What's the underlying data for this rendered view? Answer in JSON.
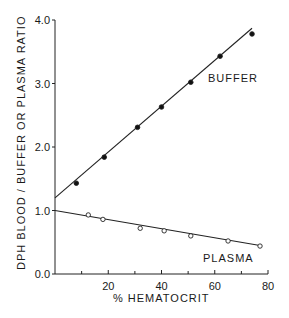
{
  "chart_data": {
    "type": "scatter",
    "title": "",
    "xlabel": "% HEMATOCRIT",
    "ylabel": "DPH BLOOD / BUFFER OR PLASMA RATIO",
    "xlim": [
      0,
      80
    ],
    "ylim": [
      0.0,
      4.0
    ],
    "x_ticks": [
      20,
      40,
      60,
      80
    ],
    "x_minor_ticks": [
      10,
      30,
      50,
      70
    ],
    "y_ticks": [
      "0.0",
      "1.0",
      "2.0",
      "3.0",
      "4.0"
    ],
    "grid": false,
    "legend": "inline labels",
    "series": [
      {
        "name": "BUFFER",
        "marker": "filled-circle",
        "points": [
          {
            "x": 8,
            "y": 1.43
          },
          {
            "x": 18.5,
            "y": 1.84
          },
          {
            "x": 31,
            "y": 2.31
          },
          {
            "x": 40,
            "y": 2.63
          },
          {
            "x": 51,
            "y": 3.02
          },
          {
            "x": 62,
            "y": 3.43
          },
          {
            "x": 74,
            "y": 3.78
          }
        ],
        "fit_line": {
          "x0": 0,
          "y0": 1.2,
          "x1": 74,
          "y1": 3.87
        }
      },
      {
        "name": "PLASMA",
        "marker": "open-circle",
        "points": [
          {
            "x": 12.5,
            "y": 0.93
          },
          {
            "x": 18,
            "y": 0.86
          },
          {
            "x": 32,
            "y": 0.72
          },
          {
            "x": 41,
            "y": 0.68
          },
          {
            "x": 51,
            "y": 0.6
          },
          {
            "x": 65,
            "y": 0.52
          },
          {
            "x": 77,
            "y": 0.44
          }
        ],
        "fit_line": {
          "x0": 0,
          "y0": 1.0,
          "x1": 77,
          "y1": 0.45
        }
      }
    ]
  },
  "labels": {
    "buffer": "BUFFER",
    "plasma": "PLASMA",
    "xlabel": "% HEMATOCRIT",
    "ylabel": "DPH BLOOD / BUFFER OR PLASMA RATIO"
  },
  "ticks": {
    "x": [
      "20",
      "40",
      "60",
      "80"
    ],
    "y": [
      "0.0",
      "1.0",
      "2.0",
      "3.0",
      "4.0"
    ]
  }
}
